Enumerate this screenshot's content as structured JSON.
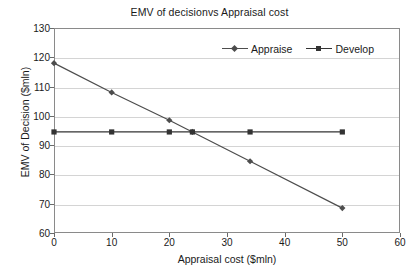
{
  "chart_data": {
    "type": "line",
    "title": "EMV of decisionvs Appraisal cost",
    "xlabel": "Appraisal cost ($mln)",
    "ylabel": "EMV of Decision ($mln)",
    "xlim": [
      0,
      60
    ],
    "ylim": [
      60,
      130
    ],
    "xticks": [
      0,
      10,
      20,
      30,
      40,
      50,
      60
    ],
    "yticks": [
      60,
      70,
      80,
      90,
      100,
      110,
      120,
      130
    ],
    "grid": true,
    "legend_position": "top-right-inside",
    "series": [
      {
        "name": "Appraise",
        "marker": "diamond",
        "color": "#4d4d4d",
        "x": [
          0,
          10,
          20,
          24,
          34,
          50
        ],
        "values": [
          118,
          108,
          98.5,
          94.5,
          84.5,
          68.5
        ]
      },
      {
        "name": "Develop",
        "marker": "square",
        "color": "#333333",
        "x": [
          0,
          10,
          20,
          24,
          34,
          50
        ],
        "values": [
          94.5,
          94.5,
          94.5,
          94.5,
          94.5,
          94.5
        ]
      }
    ]
  },
  "legend": {
    "items": [
      {
        "label": "Appraise"
      },
      {
        "label": "Develop"
      }
    ]
  }
}
